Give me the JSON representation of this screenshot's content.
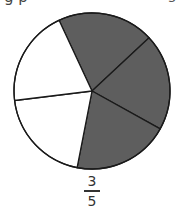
{
  "header": {
    "cropped_text_left": "g   p",
    "cropped_text_right": "5"
  },
  "chart_data": {
    "type": "pie",
    "title": "",
    "slices": [
      {
        "label": "part 1",
        "value": 1,
        "shaded": true
      },
      {
        "label": "part 2",
        "value": 1,
        "shaded": true
      },
      {
        "label": "part 3",
        "value": 1,
        "shaded": true
      },
      {
        "label": "part 4",
        "value": 1,
        "shaded": false
      },
      {
        "label": "part 5",
        "value": 1,
        "shaded": false
      }
    ],
    "start_angle_deg": 245,
    "shaded_color": "#5e5e5e",
    "unshaded_color": "#ffffff",
    "stroke_color": "#1a1a1a",
    "annotation": "3/5"
  },
  "fraction": {
    "numerator": "3",
    "denominator": "5"
  }
}
